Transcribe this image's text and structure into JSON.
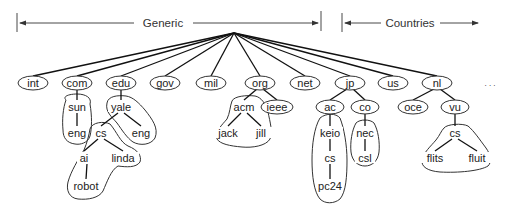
{
  "header": {
    "generic_label": "Generic",
    "countries_label": "Countries",
    "ellipsis": ". . ."
  },
  "root": {
    "x": 234,
    "y": 33
  },
  "nodes": [
    {
      "id": "int",
      "label": "int",
      "x": 33,
      "y": 83,
      "oval": true,
      "rx": 15
    },
    {
      "id": "com",
      "label": "com",
      "x": 77,
      "y": 83,
      "oval": true,
      "rx": 15
    },
    {
      "id": "edu",
      "label": "edu",
      "x": 121,
      "y": 83,
      "oval": true,
      "rx": 15
    },
    {
      "id": "gov",
      "label": "gov",
      "x": 165,
      "y": 83,
      "oval": true,
      "rx": 15
    },
    {
      "id": "mil",
      "label": "mil",
      "x": 211,
      "y": 83,
      "oval": true,
      "rx": 15
    },
    {
      "id": "org",
      "label": "org",
      "x": 260,
      "y": 83,
      "oval": true,
      "rx": 15
    },
    {
      "id": "net",
      "label": "net",
      "x": 305,
      "y": 83,
      "oval": true,
      "rx": 15
    },
    {
      "id": "jp",
      "label": "jp",
      "x": 350,
      "y": 83,
      "oval": true,
      "rx": 15
    },
    {
      "id": "us",
      "label": "us",
      "x": 393,
      "y": 83,
      "oval": true,
      "rx": 15
    },
    {
      "id": "nl",
      "label": "nl",
      "x": 437,
      "y": 83,
      "oval": true,
      "rx": 15
    },
    {
      "id": "sun",
      "label": "sun",
      "x": 77,
      "y": 107,
      "oval": false
    },
    {
      "id": "comeng",
      "label": "eng",
      "x": 77,
      "y": 133,
      "oval": false
    },
    {
      "id": "yale",
      "label": "yale",
      "x": 121,
      "y": 107,
      "oval": false
    },
    {
      "id": "yalecs",
      "label": "cs",
      "x": 101,
      "y": 133,
      "oval": false
    },
    {
      "id": "yaleeng",
      "label": "eng",
      "x": 141,
      "y": 133,
      "oval": false
    },
    {
      "id": "ai",
      "label": "ai",
      "x": 84,
      "y": 158,
      "oval": false
    },
    {
      "id": "linda",
      "label": "linda",
      "x": 123,
      "y": 158,
      "oval": false
    },
    {
      "id": "robot",
      "label": "robot",
      "x": 86,
      "y": 186,
      "oval": false
    },
    {
      "id": "acm",
      "label": "acm",
      "x": 244,
      "y": 107,
      "oval": false
    },
    {
      "id": "ieee",
      "label": "ieee",
      "x": 277,
      "y": 107,
      "oval": true,
      "rx": 16
    },
    {
      "id": "jack",
      "label": "jack",
      "x": 228,
      "y": 133,
      "oval": false
    },
    {
      "id": "jill",
      "label": "jill",
      "x": 261,
      "y": 133,
      "oval": false
    },
    {
      "id": "ac",
      "label": "ac",
      "x": 330,
      "y": 107,
      "oval": true,
      "rx": 14
    },
    {
      "id": "co",
      "label": "co",
      "x": 365,
      "y": 107,
      "oval": true,
      "rx": 14
    },
    {
      "id": "keio",
      "label": "keio",
      "x": 330,
      "y": 133,
      "oval": false
    },
    {
      "id": "jpcs",
      "label": "cs",
      "x": 330,
      "y": 158,
      "oval": false
    },
    {
      "id": "pc24",
      "label": "pc24",
      "x": 330,
      "y": 186,
      "oval": false
    },
    {
      "id": "nec",
      "label": "nec",
      "x": 365,
      "y": 133,
      "oval": false
    },
    {
      "id": "csl",
      "label": "csl",
      "x": 365,
      "y": 158,
      "oval": false
    },
    {
      "id": "oce",
      "label": "oce",
      "x": 413,
      "y": 107,
      "oval": true,
      "rx": 15
    },
    {
      "id": "vu",
      "label": "vu",
      "x": 455,
      "y": 107,
      "oval": true,
      "rx": 14
    },
    {
      "id": "vucs",
      "label": "cs",
      "x": 455,
      "y": 133,
      "oval": false
    },
    {
      "id": "flits",
      "label": "flits",
      "x": 435,
      "y": 158,
      "oval": false
    },
    {
      "id": "fluit",
      "label": "fluit",
      "x": 477,
      "y": 158,
      "oval": false
    }
  ],
  "edges": [
    [
      "root",
      "int"
    ],
    [
      "root",
      "com"
    ],
    [
      "root",
      "edu"
    ],
    [
      "root",
      "gov"
    ],
    [
      "root",
      "mil"
    ],
    [
      "root",
      "org"
    ],
    [
      "root",
      "net"
    ],
    [
      "root",
      "jp"
    ],
    [
      "root",
      "us"
    ],
    [
      "root",
      "nl"
    ],
    [
      "com",
      "sun"
    ],
    [
      "sun",
      "comeng"
    ],
    [
      "edu",
      "yale"
    ],
    [
      "yale",
      "yalecs"
    ],
    [
      "yale",
      "yaleeng"
    ],
    [
      "yalecs",
      "ai"
    ],
    [
      "yalecs",
      "linda"
    ],
    [
      "ai",
      "robot"
    ],
    [
      "org",
      "acm"
    ],
    [
      "org",
      "ieee"
    ],
    [
      "acm",
      "jack"
    ],
    [
      "acm",
      "jill"
    ],
    [
      "jp",
      "ac"
    ],
    [
      "jp",
      "co"
    ],
    [
      "ac",
      "keio"
    ],
    [
      "keio",
      "jpcs"
    ],
    [
      "jpcs",
      "pc24"
    ],
    [
      "co",
      "nec"
    ],
    [
      "nec",
      "csl"
    ],
    [
      "nl",
      "oce"
    ],
    [
      "nl",
      "vu"
    ],
    [
      "vu",
      "vucs"
    ],
    [
      "vucs",
      "flits"
    ],
    [
      "vucs",
      "fluit"
    ]
  ],
  "zones": [
    {
      "name": "zone-sun",
      "path": "M66,100 C62,96 70,94 77,94 C86,94 92,98 90,104 C92,116 92,128 90,136 C88,143 80,145 75,144 C67,143 63,138 63,130 C62,120 63,108 66,100 Z"
    },
    {
      "name": "zone-yale",
      "path": "M107,103 C108,96 118,95 126,96 C133,97 139,103 145,110 C152,119 159,128 155,138 C151,145 140,146 133,142 C127,138 122,130 117,123 C112,117 105,112 107,103 Z"
    },
    {
      "name": "zone-cs-linda-robot",
      "path": "M90,129 C92,122 104,121 110,124 C117,132 120,142 128,146 C138,150 142,156 140,162 C136,168 126,167 118,166 C111,170 107,182 103,191 C99,198 88,200 78,199 C69,198 66,190 68,182 C71,171 78,160 84,150 C87,143 89,135 90,129 Z"
    },
    {
      "name": "zone-acm",
      "path": "M232,101 C234,96 247,95 255,96 C261,97 266,104 268,112 C270,122 273,132 270,139 C266,146 252,148 242,147 C230,146 220,144 217,139 C215,131 222,125 227,119 C230,113 230,106 232,101 Z"
    },
    {
      "name": "zone-keio",
      "path": "M320,118 C326,113 336,113 340,118 C344,128 347,145 347,160 C347,176 346,192 340,199 C334,204 325,204 320,199 C314,192 312,176 312,160 C312,145 314,128 320,118 Z"
    },
    {
      "name": "zone-nec",
      "path": "M356,123 C360,119 370,119 374,123 C378,130 380,142 379,152 C378,161 372,166 365,166 C358,166 352,161 351,152 C350,142 352,130 356,123 Z"
    },
    {
      "name": "zone-vu-cs",
      "path": "M444,128 C447,124 462,123 468,126 C474,131 480,140 486,148 C491,155 492,162 488,166 C480,171 458,173 440,172 C428,171 421,167 422,160 C423,153 431,146 436,140 C440,135 441,131 444,128 Z"
    }
  ]
}
